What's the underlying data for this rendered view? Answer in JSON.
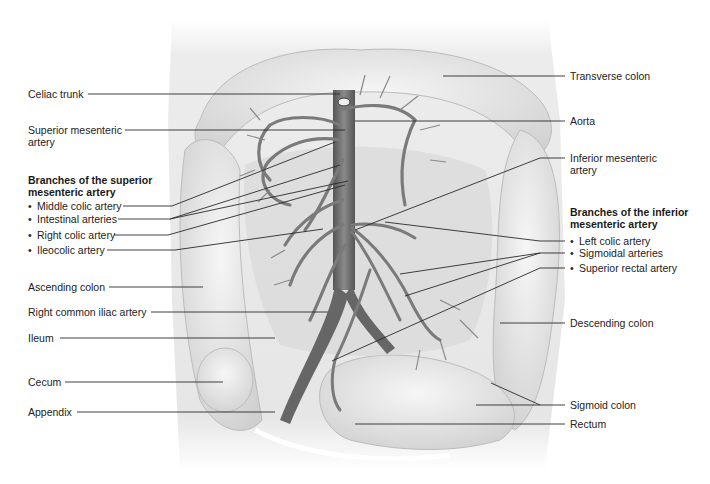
{
  "figure": {
    "colors": {
      "background": "#ffffff",
      "body": "#e9e9e9",
      "organ_fill": "#dedede",
      "vessel": "#7d7d7d",
      "aorta": "#5f5f5f",
      "leader_line": "#2a2a2a"
    }
  },
  "labels_left": {
    "celiac_trunk": "Celiac trunk",
    "superior_mesenteric_artery_1": "Superior mesenteric",
    "superior_mesenteric_artery_2": "artery",
    "sma_branches_heading_1": "Branches of the superior",
    "sma_branches_heading_2": "mesenteric artery",
    "sma_branches": [
      "Middle colic artery",
      "Intestinal arteries",
      "Right colic artery",
      "Ileocolic artery"
    ],
    "ascending_colon": "Ascending colon",
    "right_common_iliac_artery": "Right common iliac artery",
    "ileum": "Ileum",
    "cecum": "Cecum",
    "appendix": "Appendix"
  },
  "labels_right": {
    "transverse_colon": "Transverse colon",
    "aorta": "Aorta",
    "inferior_mesenteric_artery_1": "Inferior mesenteric",
    "inferior_mesenteric_artery_2": "artery",
    "ima_branches_heading_1": "Branches of the inferior",
    "ima_branches_heading_2": "mesenteric artery",
    "ima_branches": [
      "Left colic artery",
      "Sigmoidal arteries",
      "Superior rectal artery"
    ],
    "descending_colon": "Descending colon",
    "sigmoid_colon": "Sigmoid colon",
    "rectum": "Rectum"
  },
  "bullet": "•"
}
